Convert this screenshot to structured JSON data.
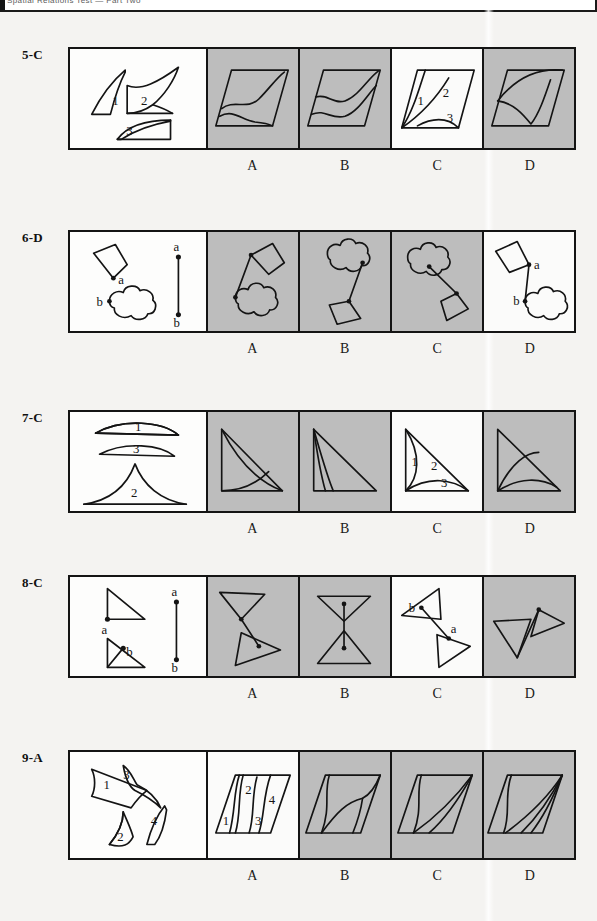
{
  "page": {
    "header_text": "Spatial Relations Test — Part Two",
    "background_color": "#f4f3f1",
    "ink_color": "#141414",
    "shaded_panel_color": "#bdbdbd",
    "white_panel_color": "#fbfbfa"
  },
  "option_letters": [
    "A",
    "B",
    "C",
    "D"
  ],
  "questions": [
    {
      "label": "5-C",
      "number": "5",
      "answer": "C",
      "stem_part_labels": [
        "1",
        "2",
        "3"
      ],
      "top": 47,
      "grid_height": 103,
      "options": [
        {
          "letter": "A",
          "correct": false
        },
        {
          "letter": "B",
          "correct": false
        },
        {
          "letter": "C",
          "correct": true,
          "labels": [
            "1",
            "2",
            "3"
          ]
        },
        {
          "letter": "D",
          "correct": false
        }
      ]
    },
    {
      "label": "6-D",
      "number": "6",
      "answer": "D",
      "stem_point_labels": [
        "a",
        "b"
      ],
      "top": 230,
      "grid_height": 103,
      "options": [
        {
          "letter": "A",
          "correct": false
        },
        {
          "letter": "B",
          "correct": false
        },
        {
          "letter": "C",
          "correct": false
        },
        {
          "letter": "D",
          "correct": true,
          "labels": [
            "a",
            "b"
          ]
        }
      ]
    },
    {
      "label": "7-C",
      "number": "7",
      "answer": "C",
      "stem_part_labels": [
        "1",
        "3",
        "2"
      ],
      "top": 410,
      "grid_height": 103,
      "options": [
        {
          "letter": "A",
          "correct": false
        },
        {
          "letter": "B",
          "correct": false
        },
        {
          "letter": "C",
          "correct": true,
          "labels": [
            "1",
            "2",
            "3"
          ]
        },
        {
          "letter": "D",
          "correct": false
        }
      ]
    },
    {
      "label": "8-C",
      "number": "8",
      "answer": "C",
      "stem_point_labels": [
        "a",
        "b"
      ],
      "top": 575,
      "grid_height": 103,
      "options": [
        {
          "letter": "A",
          "correct": false
        },
        {
          "letter": "B",
          "correct": false
        },
        {
          "letter": "C",
          "correct": true,
          "labels": [
            "b",
            "a"
          ]
        },
        {
          "letter": "D",
          "correct": false
        }
      ]
    },
    {
      "label": "9-A",
      "number": "9",
      "answer": "A",
      "stem_part_labels": [
        "1",
        "3",
        "2",
        "4"
      ],
      "top": 750,
      "grid_height": 110,
      "options": [
        {
          "letter": "A",
          "correct": true,
          "labels": [
            "1",
            "2",
            "3",
            "4"
          ]
        },
        {
          "letter": "B",
          "correct": false
        },
        {
          "letter": "C",
          "correct": false
        },
        {
          "letter": "D",
          "correct": false
        }
      ]
    }
  ]
}
